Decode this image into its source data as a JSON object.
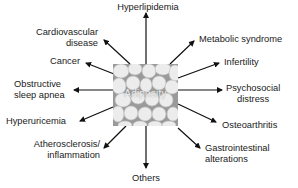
{
  "diagram": {
    "center": {
      "label": "Adiposity",
      "image": "adipose-tissue-micrograph"
    },
    "outcomes": [
      {
        "id": "hyperlipidemia",
        "label": "Hyperlipidemia"
      },
      {
        "id": "cardiovascular",
        "line1": "Cardiovascular",
        "line2": "disease"
      },
      {
        "id": "cancer",
        "label": "Cancer"
      },
      {
        "id": "osa",
        "line1": "Obstructive",
        "line2": "sleep apnea"
      },
      {
        "id": "hyperuricemia",
        "label": "Hyperuricemia"
      },
      {
        "id": "atherosclerosis",
        "line1": "Atherosclerosis/",
        "line2": "inflammation"
      },
      {
        "id": "others",
        "label": "Others"
      },
      {
        "id": "gastrointestinal",
        "line1": "Gastrointestinal",
        "line2": "alterations"
      },
      {
        "id": "osteoarthritis",
        "label": "Osteoarthritis"
      },
      {
        "id": "psychosocial",
        "line1": "Psychosocial",
        "line2": "distress"
      },
      {
        "id": "infertility",
        "label": "Infertility"
      },
      {
        "id": "metabolic",
        "label": "Metabolic syndrome"
      }
    ],
    "colors": {
      "arrow": "#111111",
      "text": "#1a1a1a",
      "background": "#ffffff"
    }
  }
}
